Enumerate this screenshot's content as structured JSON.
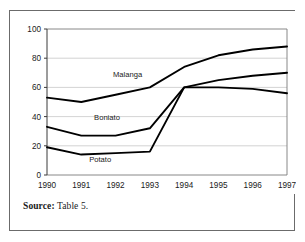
{
  "figure": {
    "source_label": "Source:",
    "source_value": " Table 5."
  },
  "chart_data": {
    "type": "line",
    "title": "",
    "subtitle": "",
    "xlabel": "",
    "ylabel": "",
    "categories": [
      "1990",
      "1991",
      "1992",
      "1993",
      "1994",
      "1995",
      "1996",
      "1997"
    ],
    "x": [
      1990,
      1991,
      1992,
      1993,
      1994,
      1995,
      1996,
      1997
    ],
    "series": [
      {
        "name": "Malanga",
        "values": [
          53,
          50,
          55,
          60,
          74,
          82,
          86,
          88
        ],
        "color": "#000000"
      },
      {
        "name": "Boniato",
        "values": [
          33,
          27,
          27,
          32,
          60,
          65,
          68,
          70
        ],
        "color": "#000000"
      },
      {
        "name": "Potato",
        "values": [
          19,
          14,
          15,
          16,
          60,
          60,
          59,
          56
        ],
        "color": "#000000"
      }
    ],
    "ylim": [
      0,
      100
    ],
    "yticks": [
      0,
      20,
      40,
      60,
      80,
      100
    ],
    "ytick_labels": [
      "0",
      "20",
      "40",
      "60",
      "80",
      "100"
    ],
    "xtick_labels": [
      "1990",
      "1991",
      "1992",
      "1993",
      "1994",
      "1995",
      "1996",
      "1997"
    ],
    "grid": {
      "horizontal": true,
      "vertical": false,
      "color": "#c8c8c8"
    },
    "legend": {
      "position": "inline-annotations",
      "entries": [
        "Malanga",
        "Boniato",
        "Potato"
      ]
    },
    "annotations": [
      {
        "text": "Malanga",
        "x": 1992.35,
        "y": 67
      },
      {
        "text": "Boniato",
        "x": 1991.75,
        "y": 38
      },
      {
        "text": "Potato",
        "x": 1991.55,
        "y": 9
      }
    ]
  }
}
